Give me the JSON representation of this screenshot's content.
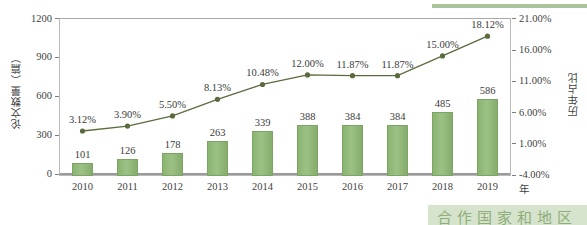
{
  "chart_data": {
    "type": "bar",
    "title": "",
    "xlabel": "年",
    "ylabel": "论文数量（篇）",
    "y2label": "历年占比",
    "categories": [
      "2010",
      "2011",
      "2012",
      "2013",
      "2014",
      "2015",
      "2016",
      "2017",
      "2018",
      "2019"
    ],
    "series": [
      {
        "name": "论文数量（篇）",
        "type": "bar",
        "axis": "left",
        "values": [
          101,
          126,
          178,
          263,
          339,
          388,
          384,
          384,
          485,
          586
        ],
        "labels": [
          "101",
          "126",
          "178",
          "263",
          "339",
          "388",
          "384",
          "384",
          "485",
          "586"
        ],
        "color": "#8cb573"
      },
      {
        "name": "历年占比",
        "type": "line",
        "axis": "right",
        "values": [
          3.12,
          3.9,
          5.5,
          8.13,
          10.48,
          12.0,
          11.87,
          11.87,
          15.0,
          18.12
        ],
        "labels": [
          "3.12%",
          "3.90%",
          "5.50%",
          "8.13%",
          "10.48%",
          "12.00%",
          "11.87%",
          "11.87%",
          "15.00%",
          "18.12%"
        ],
        "color": "#5a6b3d"
      }
    ],
    "ylim": [
      0,
      1200
    ],
    "yticks": [
      "0",
      "300",
      "600",
      "900",
      "1200"
    ],
    "y2lim": [
      -4.0,
      21.0
    ],
    "y2ticks": [
      "-4.00%",
      "1.00%",
      "6.00%",
      "11.00%",
      "16.00%",
      "21.00%"
    ],
    "grid": false,
    "legend": "none"
  },
  "footer": {
    "caption": "合作国家和地区"
  }
}
